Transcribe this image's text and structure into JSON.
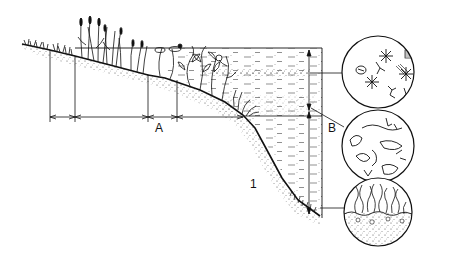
{
  "diagram": {
    "colors": {
      "ink": "#111111",
      "background": "#ffffff",
      "stipple": "#333333"
    },
    "labels": {
      "zone_a": "A",
      "zone_b": "B",
      "zone_1": "1"
    },
    "zones": [
      {
        "id": "shore",
        "description": "shoreline grasses"
      },
      {
        "id": "emergent",
        "description": "emergent reeds"
      },
      {
        "id": "floating",
        "description": "floating-leaved and submerged plants"
      },
      {
        "id": "littoral-edge",
        "description": "submerged plants at drop-off"
      },
      {
        "id": "open-water",
        "description": "pelagic water column"
      },
      {
        "id": "profundal",
        "description": "deep lake bottom"
      }
    ],
    "insets": [
      {
        "id": "plankton",
        "description": "phytoplankton and zooplankton (stars, algae, copepods)"
      },
      {
        "id": "nekton",
        "description": "swimming invertebrates and larvae"
      },
      {
        "id": "benthos",
        "description": "bottom-dwelling worms in sediment"
      }
    ]
  }
}
